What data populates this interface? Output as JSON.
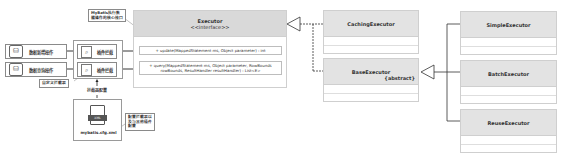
{
  "diagram": {
    "operations": [
      {
        "label": "数据新增操作",
        "icon": "database-icon"
      },
      {
        "label": "数据查询操作",
        "icon": "database-icon"
      }
    ],
    "plugins": [
      {
        "label": "插件拦截",
        "icon": "interceptor-icon"
      },
      {
        "label": "插件拦截",
        "icon": "interceptor-icon"
      }
    ],
    "notes": {
      "executor_note": "MyBatis执行数据操作的核心接口",
      "custom_interceptor": "自定义拦截器",
      "interceptor_config": "拦截器配置",
      "config_note": "配置拦截器以及与其他插件配置"
    },
    "config_file": {
      "label": "mybatis.cfg.xml",
      "icon": "xml-file-icon"
    },
    "executor": {
      "name": "Executor",
      "stereotype": "<<interface>>",
      "methods": [
        "+ update(MappedStatement ms, Object parameter) : int",
        "+ query(MappedStatement ms, Object parameter, RowBounds rowBounds, ResultHandler resultHandler) : List<E>"
      ]
    },
    "caching_executor": {
      "name": "CachingExecutor"
    },
    "base_executor": {
      "name": "BaseExecutor",
      "stereotype": "{abstract}"
    },
    "subclasses": [
      {
        "name": "SimpleExecutor"
      },
      {
        "name": "BatchExecutor"
      },
      {
        "name": "ReuseExecutor"
      }
    ],
    "colors": {
      "class_header": "#e3e3e3",
      "interface_header": "#d9d9d9",
      "border": "#cfcfcf",
      "line": "#333333"
    }
  }
}
